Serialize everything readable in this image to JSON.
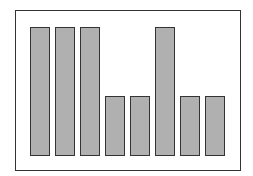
{
  "chart_data": {
    "type": "bar",
    "title": "",
    "xlabel": "",
    "ylabel": "",
    "categories": [
      "1",
      "2",
      "3",
      "4",
      "5",
      "6",
      "7",
      "8"
    ],
    "values": [
      13,
      13,
      13,
      6,
      6,
      13,
      6,
      6
    ],
    "ylim": [
      0,
      15
    ],
    "grid": false,
    "legend": null,
    "colors": {
      "bar_fill": "#b0b0b0",
      "bar_edge": "#333333",
      "frame": "#333333",
      "background": "#ffffff"
    }
  }
}
